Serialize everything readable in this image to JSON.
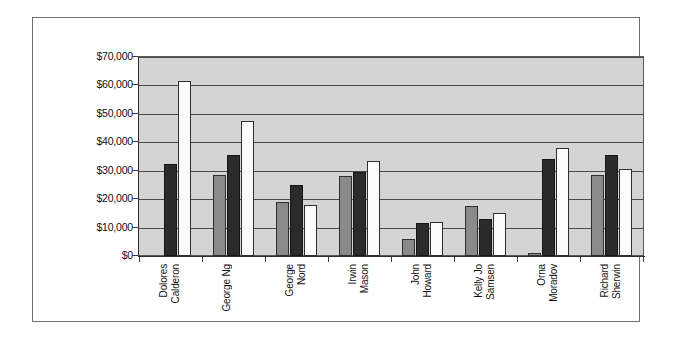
{
  "chart_data": {
    "type": "bar",
    "title": "",
    "subtitle": "",
    "xlabel": "",
    "ylabel": "",
    "ylim": [
      0,
      70000
    ],
    "y_tick_labels": [
      "$70,000",
      "$60,000",
      "$50,000",
      "$40,000",
      "$30,000",
      "$20,000",
      "$10,000",
      "$0"
    ],
    "y_tick_values": [
      70000,
      60000,
      50000,
      40000,
      30000,
      20000,
      10000,
      0
    ],
    "grid": true,
    "legend_position": "none",
    "categories": [
      "Dolores Calderon",
      "George Ng",
      "George Nord",
      "Irwin Mason",
      "John Howard",
      "Kelly Jo Samsen",
      "Orna Moradov",
      "Richard Sherwin"
    ],
    "category_lines": [
      [
        "Dolores",
        "Calderon"
      ],
      [
        "George Ng"
      ],
      [
        "George",
        "Nord"
      ],
      [
        "Irwin",
        "Mason"
      ],
      [
        "John",
        "Howard"
      ],
      [
        "Kelly Jo",
        "Samsen"
      ],
      [
        "Orna",
        "Moradov"
      ],
      [
        "Richard",
        "Sherwin"
      ]
    ],
    "series": [
      {
        "name": "Series 1",
        "color": "#8a8a8a",
        "values": [
          0,
          28500,
          19000,
          28000,
          6000,
          17500,
          1000,
          28500
        ]
      },
      {
        "name": "Series 2",
        "color": "#2b2b2b",
        "values": [
          32500,
          35500,
          25000,
          29500,
          11500,
          13000,
          34000,
          35500
        ]
      },
      {
        "name": "Series 3",
        "color": "#fbfbfb",
        "values": [
          61500,
          47500,
          18000,
          33500,
          12000,
          15000,
          38000,
          30500
        ]
      }
    ]
  },
  "style": {
    "plot_background": "#d4d4d4",
    "figure_background": "#ffffff",
    "gridline_color": "#4a4a4a",
    "axis_color": "#2d2d2d",
    "frame_color": "#6f6f6f"
  }
}
